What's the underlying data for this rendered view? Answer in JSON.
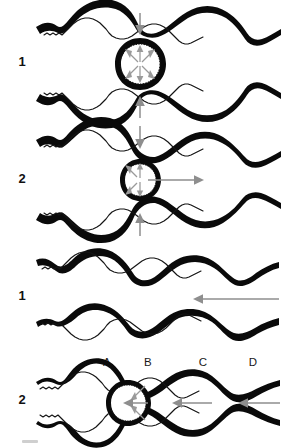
{
  "figure": {
    "background_color": "#ffffff",
    "ink_color": "#0a0a0a",
    "arrow_color": "#8e8e8e",
    "radial_arrow_color": "#9a9a9a",
    "width": 285,
    "height": 448,
    "panels": [
      {
        "id": "panel-1-top",
        "number_label": "1",
        "number_x": 22,
        "number_y": 66,
        "baseline_y": 64,
        "gap": 0,
        "contact": "closed",
        "description": "Occluded segment with circular bulge at center; radial outward arrows inside bulge; vertical compressive arrows above and below.",
        "arrows": {
          "top_vertical": {
            "x": 140,
            "y1": 14,
            "y2": 33,
            "direction": "down"
          },
          "bottom_vertical": {
            "x": 140,
            "y1": 118,
            "y2": 99,
            "direction": "up"
          },
          "radial_count": 8
        }
      },
      {
        "id": "panel-2-top",
        "number_label": "2",
        "number_x": 22,
        "number_y": 183,
        "baseline_y": 180,
        "gap": 0,
        "contact": "closed",
        "description": "Occluded segment with smaller bulge; radial arrows plus long horizontal arrow directed to the right indicating distal propulsion.",
        "arrows": {
          "top_vertical": {
            "x": 140,
            "y1": 126,
            "y2": 152,
            "direction": "down"
          },
          "bottom_vertical": {
            "x": 140,
            "y1": 236,
            "y2": 211,
            "direction": "up"
          },
          "horizontal": {
            "x1": 148,
            "x2": 200,
            "y": 180,
            "direction": "right"
          },
          "radial_count": 6
        }
      },
      {
        "id": "panel-1-bottom",
        "number_label": "1",
        "number_x": 22,
        "number_y": 300,
        "baseline_y": 298,
        "gap": 34,
        "contact": "open",
        "description": "Open lumen, upper and lower walls separated; single long horizontal arrow directed to the left.",
        "arrows": {
          "horizontal": {
            "x1": 278,
            "x2": 194,
            "y": 299,
            "direction": "left"
          }
        }
      },
      {
        "id": "panel-2-bottom",
        "number_label": "2",
        "number_x": 22,
        "number_y": 404,
        "baseline_y": 400,
        "gap": 0,
        "contact": "closed",
        "description": "Occluded segment at position A with radial arrows; three horizontal arrows directed to the left through segments B, C and D.",
        "arrows": {
          "horizontal_near": {
            "x1": 130,
            "x2": 109,
            "y": 401,
            "direction": "left"
          },
          "horizontal_mid": {
            "x1": 196,
            "x2": 160,
            "y": 401,
            "direction": "left"
          },
          "horizontal_far": {
            "x1": 278,
            "x2": 228,
            "y": 401,
            "direction": "left"
          },
          "radial_count": 3
        },
        "segment_labels": [
          {
            "text": "A",
            "x": 107,
            "y": 366
          },
          {
            "text": "B",
            "x": 148,
            "y": 366
          },
          {
            "text": "C",
            "x": 203,
            "y": 366
          },
          {
            "text": "D",
            "x": 253,
            "y": 366
          }
        ]
      }
    ]
  }
}
